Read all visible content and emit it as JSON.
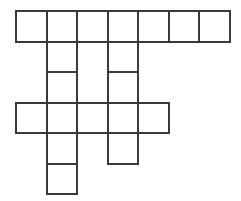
{
  "puzzle": {
    "title": "crossword-grid",
    "type": "crossword-blank-grid",
    "columns": 7,
    "rows": 6,
    "cell_size": 30.5,
    "origin_x": 15,
    "origin_y": 10,
    "border_width": 2,
    "colors": {
      "background": "#ffffff",
      "cell_fill": "#ffffff",
      "cell_border": "#3a3a3a"
    },
    "cells": [
      {
        "row": 0,
        "col": 0,
        "state": "empty",
        "label": ""
      },
      {
        "row": 0,
        "col": 1,
        "state": "empty",
        "label": ""
      },
      {
        "row": 0,
        "col": 2,
        "state": "empty",
        "label": ""
      },
      {
        "row": 0,
        "col": 3,
        "state": "empty",
        "label": ""
      },
      {
        "row": 0,
        "col": 4,
        "state": "empty",
        "label": ""
      },
      {
        "row": 0,
        "col": 5,
        "state": "empty",
        "label": ""
      },
      {
        "row": 0,
        "col": 6,
        "state": "empty",
        "label": ""
      },
      {
        "row": 1,
        "col": 1,
        "state": "empty",
        "label": ""
      },
      {
        "row": 1,
        "col": 3,
        "state": "empty",
        "label": ""
      },
      {
        "row": 2,
        "col": 1,
        "state": "empty",
        "label": ""
      },
      {
        "row": 2,
        "col": 3,
        "state": "empty",
        "label": ""
      },
      {
        "row": 3,
        "col": 0,
        "state": "empty",
        "label": ""
      },
      {
        "row": 3,
        "col": 1,
        "state": "empty",
        "label": ""
      },
      {
        "row": 3,
        "col": 2,
        "state": "empty",
        "label": ""
      },
      {
        "row": 3,
        "col": 3,
        "state": "empty",
        "label": ""
      },
      {
        "row": 3,
        "col": 4,
        "state": "empty",
        "label": ""
      },
      {
        "row": 4,
        "col": 1,
        "state": "empty",
        "label": ""
      },
      {
        "row": 4,
        "col": 3,
        "state": "empty",
        "label": ""
      },
      {
        "row": 5,
        "col": 1,
        "state": "empty",
        "label": ""
      }
    ],
    "entries": {
      "across": [
        {
          "row": 0,
          "col_start": 0,
          "length": 7,
          "answer": ""
        },
        {
          "row": 3,
          "col_start": 0,
          "length": 5,
          "answer": ""
        }
      ],
      "down": [
        {
          "col": 1,
          "row_start": 0,
          "length": 6,
          "answer": ""
        },
        {
          "col": 3,
          "row_start": 0,
          "length": 5,
          "answer": ""
        },
        {
          "col": 0,
          "row_start": 3,
          "length": 1,
          "answer": ""
        },
        {
          "col": 2,
          "row_start": 3,
          "length": 1,
          "answer": ""
        },
        {
          "col": 4,
          "row_start": 3,
          "length": 1,
          "answer": ""
        }
      ]
    }
  }
}
